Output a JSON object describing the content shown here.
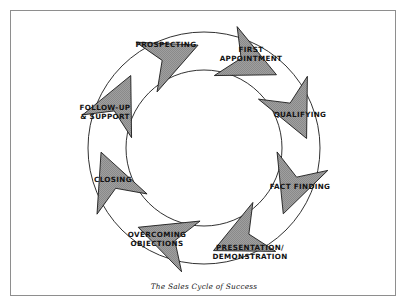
{
  "page": {
    "title": "The Sales Cycle of Success",
    "background_color": "#ffffff",
    "frame_color": "#8e8e8e"
  },
  "caption": {
    "text": "The Sales Cycle of Success"
  },
  "chart_data": {
    "type": "diagram",
    "subtype": "cycle",
    "title": "The Sales Cycle of Success",
    "direction": "clockwise",
    "arrow_fill": "#9a9a9a",
    "arrow_stroke": "#1a1a1a",
    "ring_stroke": "#1a1a1a",
    "steps": [
      {
        "index": 1,
        "label": "PROSPECTING",
        "lines": [
          "PROSPECTING"
        ],
        "angle_deg": 295,
        "label_x": 166,
        "label_y": 45
      },
      {
        "index": 2,
        "label": "FIRST APPOINTMENT",
        "lines": [
          "FIRST",
          "APPOINTMENT"
        ],
        "angle_deg": 337,
        "label_x": 251,
        "label_y": 50
      },
      {
        "index": 3,
        "label": "QUALIFYING",
        "lines": [
          "QUALIFYING"
        ],
        "angle_deg": 25,
        "label_x": 300,
        "label_y": 115
      },
      {
        "index": 4,
        "label": "FACT FINDING",
        "lines": [
          "FACT FINDING"
        ],
        "angle_deg": 65,
        "label_x": 300,
        "label_y": 187
      },
      {
        "index": 5,
        "label": "PRESENTATION/ DEMONSTRATION",
        "lines": [
          "PRESENTATION/",
          "DEMONSTRATION"
        ],
        "angle_deg": 110,
        "label_x": 250,
        "label_y": 248
      },
      {
        "index": 6,
        "label": "OVERCOMING OBJECTIONS",
        "lines": [
          "OVERCOMING",
          "OBJECTIONS"
        ],
        "angle_deg": 155,
        "label_x": 157,
        "label_y": 235
      },
      {
        "index": 7,
        "label": "CLOSING",
        "lines": [
          "CLOSING"
        ],
        "angle_deg": 200,
        "label_x": 113,
        "label_y": 180
      },
      {
        "index": 8,
        "label": "FOLLOW-UP & SUPPORT",
        "lines": [
          "FOLLOW-UP",
          "& SUPPORT"
        ],
        "angle_deg": 248,
        "label_x": 105,
        "label_y": 108
      }
    ],
    "ring": {
      "center_x": 204,
      "center_y": 148,
      "outer_radius": 116,
      "inner_radius": 78
    }
  }
}
